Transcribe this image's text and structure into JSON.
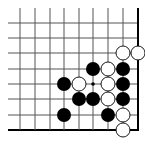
{
  "board": {
    "description": "Go problem diagram, lower-right corner",
    "columns_x": [
      20,
      35,
      50,
      64,
      79,
      93,
      108,
      123,
      138
    ],
    "rows_y": [
      23,
      38,
      53,
      69,
      84,
      99,
      115,
      130
    ],
    "line_start_x": 8,
    "line_start_y": 8,
    "right_edge_x": 138,
    "bottom_edge_y": 130,
    "stone_radius": 7,
    "colors": {
      "background": "#ffffff",
      "line": "#555555",
      "edge": "#000000",
      "black_stone": "#000000",
      "white_stone_fill": "#ffffff",
      "white_stone_stroke": "#000000"
    },
    "star_points": [
      {
        "col": 5,
        "row": 4
      }
    ],
    "stones": [
      {
        "color": "white",
        "col": 7,
        "row": 2
      },
      {
        "color": "white",
        "col": 8,
        "row": 2
      },
      {
        "color": "black",
        "col": 5,
        "row": 3
      },
      {
        "color": "white",
        "col": 6,
        "row": 3
      },
      {
        "color": "black",
        "col": 7,
        "row": 3
      },
      {
        "color": "black",
        "col": 3,
        "row": 4
      },
      {
        "color": "white",
        "col": 4,
        "row": 4
      },
      {
        "color": "white",
        "col": 6,
        "row": 4
      },
      {
        "color": "black",
        "col": 7,
        "row": 4
      },
      {
        "color": "black",
        "col": 4,
        "row": 5
      },
      {
        "color": "black",
        "col": 5,
        "row": 5
      },
      {
        "color": "white",
        "col": 6,
        "row": 5
      },
      {
        "color": "black",
        "col": 7,
        "row": 5
      },
      {
        "color": "black",
        "col": 3,
        "row": 6
      },
      {
        "color": "black",
        "col": 6,
        "row": 6
      },
      {
        "color": "white",
        "col": 7,
        "row": 6
      },
      {
        "color": "white",
        "col": 7,
        "row": 7
      }
    ]
  }
}
